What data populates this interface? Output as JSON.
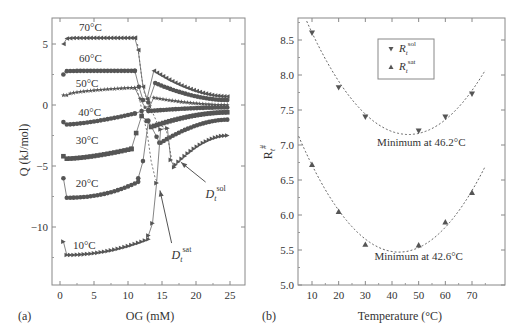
{
  "figure": {
    "panel_a_label": "(a)",
    "panel_b_label": "(b)"
  },
  "chart_data": [
    {
      "id": "a",
      "type": "line",
      "title": "",
      "xlabel": "OG (mM)",
      "ylabel": "Q (kJ/mol)",
      "xlim": [
        -1,
        27
      ],
      "ylim": [
        -14.5,
        7
      ],
      "xticks": [
        0,
        5,
        10,
        15,
        20,
        25
      ],
      "yticks": [
        5,
        0,
        -5,
        -10
      ],
      "grid": false,
      "legend": null,
      "colors": {
        "series": "#555555",
        "axis": "#777777",
        "text": "#333333"
      },
      "series": [
        {
          "name": "70°C",
          "marker": "triangle-left",
          "pre": {
            "x": [
              0.5,
              11.0
            ],
            "start": 5.0,
            "plateau": 5.5
          },
          "transition": [
            [
              11.0,
              5.5
            ],
            [
              11.5,
              4.5
            ],
            [
              12.2,
              1.5
            ],
            [
              12.8,
              0.5
            ]
          ],
          "post": {
            "x0": 13.8,
            "x1": 24.6,
            "y0": 2.8,
            "y1": 0.7
          }
        },
        {
          "name": "60°C",
          "marker": "circle",
          "pre": {
            "x": [
              0.5,
              11.0
            ],
            "start": 2.5,
            "plateau": 2.8
          },
          "transition": [
            [
              11.0,
              2.8
            ],
            [
              11.6,
              1.5
            ],
            [
              12.2,
              0.4
            ],
            [
              13.0,
              0.2
            ]
          ],
          "post": {
            "x0": 14.0,
            "x1": 24.6,
            "y0": 1.8,
            "y1": 0.4
          }
        },
        {
          "name": "50°C",
          "marker": "star",
          "pre": {
            "x": [
              0.5,
              11.0
            ],
            "start": 0.8,
            "plateau": 1.4
          },
          "transition": [
            [
              11.0,
              1.4
            ],
            [
              11.8,
              0.5
            ],
            [
              12.5,
              -0.2
            ],
            [
              13.2,
              -0.1
            ]
          ],
          "post": {
            "x0": 13.8,
            "x1": 24.6,
            "y0": 0.6,
            "y1": 0.0
          }
        },
        {
          "name": "40°C",
          "marker": "circle",
          "pre": {
            "x": [
              0.5,
              11.0
            ],
            "start": -1.4,
            "plateau": -0.7
          },
          "transition": [
            [
              11.0,
              -0.7
            ],
            [
              12.0,
              -0.5
            ],
            [
              13.0,
              -0.4
            ]
          ],
          "post": {
            "x0": 13.0,
            "x1": 24.6,
            "y0": -0.5,
            "y1": -0.2
          }
        },
        {
          "name": "30°C",
          "marker": "square",
          "pre": {
            "x": [
              0.5,
              10.5
            ],
            "start": -4.2,
            "plateau": -3.6
          },
          "transition": [
            [
              10.5,
              -3.6
            ],
            [
              11.2,
              -2.3
            ],
            [
              12.0,
              -0.9
            ],
            [
              12.8,
              -1.3
            ]
          ],
          "post": {
            "x0": 13.4,
            "x1": 24.6,
            "y0": -1.8,
            "y1": -0.6
          }
        },
        {
          "name": "20°C",
          "marker": "circle",
          "pre": {
            "x": [
              0.5,
              11.5
            ],
            "start": -6.0,
            "plateau": -6.3
          },
          "transition": [
            [
              11.5,
              -6.0
            ],
            [
              12.2,
              -4.6
            ],
            [
              13.0,
              -1.3
            ],
            [
              14.2,
              -2.6
            ],
            [
              14.6,
              -3.1
            ]
          ],
          "post": {
            "x0": 14.8,
            "x1": 24.6,
            "y0": -3.1,
            "y1": -1.2
          }
        },
        {
          "name": "10°C",
          "marker": "triangle-right",
          "pre": {
            "x": [
              0.5,
              13.0
            ],
            "start": -11.2,
            "plateau": -11.0
          },
          "transition": [
            [
              13.0,
              -10.7
            ],
            [
              13.6,
              -9.7
            ],
            [
              14.2,
              -6.4
            ],
            [
              14.8,
              -2.0
            ],
            [
              15.8,
              -1.9
            ],
            [
              16.3,
              -4.5
            ],
            [
              16.8,
              -5.1
            ]
          ],
          "post": {
            "x0": 17.0,
            "x1": 24.6,
            "y0": -4.9,
            "y1": -2.5
          }
        }
      ],
      "temperature_labels": [
        {
          "text": "70°C",
          "x": 2.8,
          "y": 6.1
        },
        {
          "text": "60°C",
          "x": 2.8,
          "y": 3.5
        },
        {
          "text": "50°C",
          "x": 2.3,
          "y": 1.5
        },
        {
          "text": "40°C",
          "x": 2.7,
          "y": -0.9
        },
        {
          "text": "30°C",
          "x": 2.3,
          "y": -3.2
        },
        {
          "text": "20°C",
          "x": 2.3,
          "y": -6.7
        },
        {
          "text": "10°C",
          "x": 1.9,
          "y": -11.8
        }
      ],
      "dashed_boundaries": [
        {
          "name": "D_t^sol",
          "points": [
            [
              11.4,
              5.0
            ],
            [
              12.0,
              2.3
            ],
            [
              12.4,
              1.0
            ],
            [
              12.9,
              0.3
            ],
            [
              13.6,
              -0.6
            ],
            [
              14.4,
              -1.6
            ],
            [
              15.6,
              -1.9
            ],
            [
              16.4,
              -4.4
            ]
          ]
        },
        {
          "name": "D_t^sat",
          "points": [
            [
              11.3,
              1.3
            ],
            [
              11.7,
              0.5
            ],
            [
              12.2,
              -0.9
            ],
            [
              12.8,
              -2.2
            ],
            [
              13.4,
              -4.6
            ],
            [
              14.0,
              -6.0
            ],
            [
              14.4,
              -6.4
            ]
          ]
        }
      ],
      "annotations": [
        {
          "label_main": "D",
          "label_sub": "t",
          "label_sup": "sol",
          "text_x": 22.0,
          "text_y": -7.3,
          "arrow_to": [
            17.8,
            -4.7
          ]
        },
        {
          "label_main": "D",
          "label_sub": "t",
          "label_sup": "sat",
          "text_x": 17.0,
          "text_y": -12.3,
          "arrow_to": [
            14.7,
            -7.0
          ]
        }
      ]
    },
    {
      "id": "b",
      "type": "scatter",
      "title": "",
      "xlabel": "Temperature (°C)",
      "ylabel": "R_t^#",
      "xlim": [
        5,
        75
      ],
      "ylim": [
        5.0,
        8.8
      ],
      "xticks": [
        10,
        20,
        30,
        40,
        50,
        60,
        70
      ],
      "yticks": [
        5.0,
        5.5,
        6.0,
        6.5,
        7.0,
        7.5,
        8.0,
        8.5
      ],
      "grid": false,
      "legend": {
        "position": "upper-center",
        "entries": [
          {
            "main": "R",
            "sub": "t",
            "sup": "sol",
            "marker": "triangle-down"
          },
          {
            "main": "R",
            "sub": "t",
            "sup": "sat",
            "marker": "triangle-up"
          }
        ]
      },
      "series": [
        {
          "name": "R_t^sol",
          "marker": "triangle-down",
          "x": [
            10,
            20,
            30,
            50,
            60,
            70
          ],
          "y": [
            8.6,
            7.82,
            7.4,
            7.2,
            7.4,
            7.73
          ],
          "fit": {
            "type": "quadratic",
            "vertex_x": 46.2,
            "vertex_y": 7.15,
            "a": 0.00111
          }
        },
        {
          "name": "R_t^sat",
          "marker": "triangle-up",
          "x": [
            10,
            20,
            30,
            50,
            60,
            70
          ],
          "y": [
            6.72,
            6.05,
            5.58,
            5.57,
            5.9,
            6.32
          ],
          "fit": {
            "type": "quadratic",
            "vertex_x": 42.6,
            "vertex_y": 5.47,
            "a": 0.00117
          }
        }
      ],
      "annotations": [
        {
          "text": "Minimum at 46.2°C",
          "x": 51,
          "y": 6.98
        },
        {
          "text": "Minimum at 42.6°C",
          "x": 50,
          "y": 5.36
        }
      ]
    }
  ]
}
